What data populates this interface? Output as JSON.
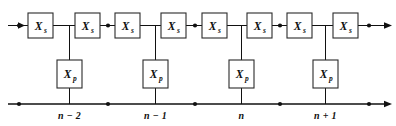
{
  "figure": {
    "type": "ladder-network-schematic",
    "title": "",
    "background_color": "#ffffff",
    "line_color": "#111111",
    "box_fill": "#ffffff",
    "box_stroke": "#2a2a2a",
    "width": 396,
    "height": 126
  },
  "series_branch": {
    "label_base": "X",
    "label_sub": "s",
    "count": 8,
    "boxes": [
      {
        "id": "xs-1",
        "label_base": "X",
        "label_sub": "s",
        "x": 28,
        "y": 13,
        "w": 25,
        "h": 25
      },
      {
        "id": "xs-2",
        "label_base": "X",
        "label_sub": "s",
        "x": 75,
        "y": 13,
        "w": 25,
        "h": 25
      },
      {
        "id": "xs-3",
        "label_base": "X",
        "label_sub": "s",
        "x": 115,
        "y": 13,
        "w": 25,
        "h": 25
      },
      {
        "id": "xs-4",
        "label_base": "X",
        "label_sub": "s",
        "x": 161,
        "y": 13,
        "w": 25,
        "h": 25
      },
      {
        "id": "xs-5",
        "label_base": "X",
        "label_sub": "s",
        "x": 202,
        "y": 13,
        "w": 25,
        "h": 25
      },
      {
        "id": "xs-6",
        "label_base": "X",
        "label_sub": "s",
        "x": 247,
        "y": 13,
        "w": 25,
        "h": 25
      },
      {
        "id": "xs-7",
        "label_base": "X",
        "label_sub": "s",
        "x": 287,
        "y": 13,
        "w": 25,
        "h": 25
      },
      {
        "id": "xs-8",
        "label_base": "X",
        "label_sub": "s",
        "x": 333,
        "y": 13,
        "w": 25,
        "h": 25
      }
    ]
  },
  "shunt_branch": {
    "label_base": "X",
    "label_sub": "p",
    "count": 4,
    "boxes": [
      {
        "id": "xp-1",
        "label_base": "X",
        "label_sub": "p",
        "x": 57,
        "y": 60,
        "w": 25,
        "h": 28
      },
      {
        "id": "xp-2",
        "label_base": "X",
        "label_sub": "p",
        "x": 143,
        "y": 60,
        "w": 25,
        "h": 28
      },
      {
        "id": "xp-3",
        "label_base": "X",
        "label_sub": "p",
        "x": 229,
        "y": 60,
        "w": 25,
        "h": 28
      },
      {
        "id": "xp-4",
        "label_base": "X",
        "label_sub": "p",
        "x": 313,
        "y": 60,
        "w": 25,
        "h": 28
      }
    ]
  },
  "top_rail": {
    "y": 25.5,
    "x_start": 8,
    "x_end": 389,
    "arrow_left": {
      "x": 8,
      "y": 25.5,
      "direction": "right"
    },
    "arrow_right": {
      "x": 389,
      "y": 25.5,
      "direction": "right"
    },
    "dots_x": [
      19,
      108,
      195,
      280,
      369
    ]
  },
  "bottom_rail": {
    "y": 104,
    "x_start": 8,
    "x_end": 389,
    "arrow_right": {
      "x": 389,
      "y": 104,
      "direction": "right"
    },
    "dots_x": [
      19,
      108,
      195,
      280,
      369
    ]
  },
  "vertical_drops": [
    {
      "id": "drop-1",
      "x": 69.5,
      "y_top": 25.5,
      "y_bottom": 104
    },
    {
      "id": "drop-2",
      "x": 155.5,
      "y_top": 25.5,
      "y_bottom": 104
    },
    {
      "id": "drop-3",
      "x": 241.5,
      "y_top": 25.5,
      "y_bottom": 104
    },
    {
      "id": "drop-4",
      "x": 325.5,
      "y_top": 25.5,
      "y_bottom": 104
    }
  ],
  "node_labels": [
    {
      "id": "node-n-minus-2",
      "text": "n − 2",
      "x": 69.5,
      "y": 119
    },
    {
      "id": "node-n-minus-1",
      "text": "n − 1",
      "x": 155.5,
      "y": 119
    },
    {
      "id": "node-n",
      "text": "n",
      "x": 241.5,
      "y": 119
    },
    {
      "id": "node-n-plus-1",
      "text": "n + 1",
      "x": 325.5,
      "y": 119
    }
  ],
  "tick_marks": [
    {
      "x": 69.5,
      "y_top": 98,
      "y_bottom": 104
    },
    {
      "x": 155.5,
      "y_top": 98,
      "y_bottom": 104
    },
    {
      "x": 241.5,
      "y_top": 98,
      "y_bottom": 104
    },
    {
      "x": 325.5,
      "y_top": 98,
      "y_bottom": 104
    }
  ]
}
